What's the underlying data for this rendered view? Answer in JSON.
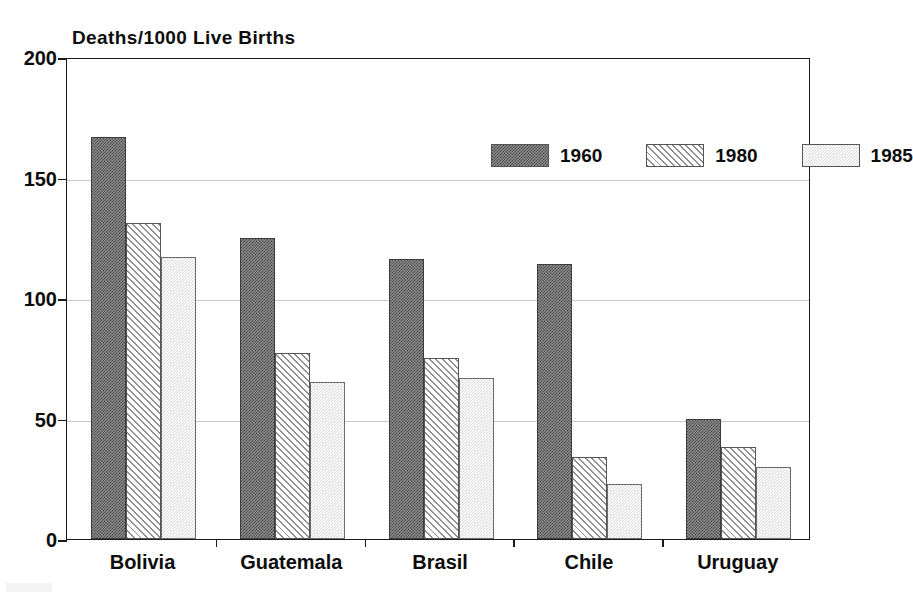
{
  "chart_data": {
    "type": "bar",
    "title": "Deaths/1000 Live Births",
    "xlabel": "",
    "ylabel": "",
    "ylim": [
      0,
      200
    ],
    "yticks": [
      0,
      50,
      100,
      150,
      200
    ],
    "grid": true,
    "legend_position": "top-right-inside",
    "categories": [
      "Bolivia",
      "Guatemala",
      "Brasil",
      "Chile",
      "Uruguay"
    ],
    "series": [
      {
        "name": "1960",
        "values": [
          167,
          125,
          116,
          114,
          50
        ]
      },
      {
        "name": "1980",
        "values": [
          131,
          77,
          75,
          34,
          38
        ]
      },
      {
        "name": "1985",
        "values": [
          117,
          65,
          67,
          23,
          30
        ]
      }
    ]
  },
  "axes": {
    "y_tick_labels": [
      "200",
      "150",
      "100",
      "50",
      "0"
    ],
    "x_tick_labels": [
      "Bolivia",
      "Guatemala",
      "Brasil",
      "Chile",
      "Uruguay"
    ]
  },
  "legend": {
    "entries": [
      {
        "label": "1960",
        "swatch": "dark-stipple-swatch",
        "color": "#6d6d6d"
      },
      {
        "label": "1980",
        "swatch": "diagonal-hatch-swatch",
        "color": "#8e8e8e"
      },
      {
        "label": "1985",
        "swatch": "light-stipple-swatch",
        "color": "#e2e2e2"
      }
    ]
  },
  "colors": {
    "axis": "#1a1a1a",
    "grid": "#c9c9c9",
    "text": "#0d0d0d",
    "background": "#ffffff"
  }
}
